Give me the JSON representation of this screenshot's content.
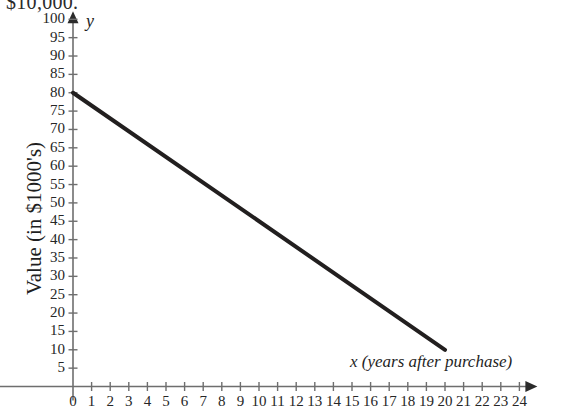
{
  "header": {
    "cropped_text": "$10,000."
  },
  "chart_data": {
    "type": "line",
    "title": "",
    "xlabel": "x (years after purchase)",
    "ylabel": "Value (in $1000's)",
    "y_axis_variable": "y",
    "xlim": [
      -5,
      24
    ],
    "ylim": [
      0,
      100
    ],
    "grid": false,
    "legend": null,
    "x_tick_labels": [
      "-5",
      "0",
      "1",
      "2",
      "3",
      "4",
      "5",
      "6",
      "7",
      "8",
      "9",
      "10",
      "11",
      "12",
      "13",
      "14",
      "15",
      "16",
      "17",
      "18",
      "19",
      "20",
      "21",
      "22",
      "23",
      "24"
    ],
    "x_tick_values": [
      -5,
      0,
      1,
      2,
      3,
      4,
      5,
      6,
      7,
      8,
      9,
      10,
      11,
      12,
      13,
      14,
      15,
      16,
      17,
      18,
      19,
      20,
      21,
      22,
      23,
      24
    ],
    "y_tick_labels": [
      "5",
      "10",
      "15",
      "20",
      "25",
      "30",
      "35",
      "40",
      "45",
      "50",
      "55",
      "60",
      "65",
      "70",
      "75",
      "80",
      "85",
      "90",
      "95",
      "100"
    ],
    "y_tick_values": [
      5,
      10,
      15,
      20,
      25,
      30,
      35,
      40,
      45,
      50,
      55,
      60,
      65,
      70,
      75,
      80,
      85,
      90,
      95,
      100
    ],
    "series": [
      {
        "name": "Value",
        "color": "#221f1f",
        "line_width": 4,
        "x": [
          0,
          20
        ],
        "values": [
          80,
          10
        ],
        "slope": -3.5,
        "intercept": 80
      }
    ],
    "axis_color": "#6e6e6e",
    "axis_arrows": [
      "x-right",
      "y-up"
    ]
  }
}
